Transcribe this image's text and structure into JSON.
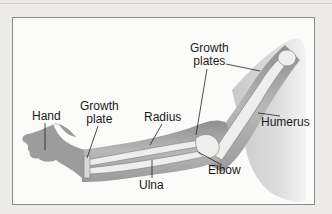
{
  "figure": {
    "labels": {
      "growth_plates": [
        "Growth",
        "plates"
      ],
      "hand": "Hand",
      "growth_plate": [
        "Growth",
        "plate"
      ],
      "radius": "Radius",
      "humerus": "Humerus",
      "elbow": "Elbow",
      "ulna": "Ulna"
    }
  },
  "colors": {
    "background": "#ecebe9",
    "panel": "#fbfbfa",
    "skin": "#a9a9a9",
    "bone": "#eeeeec",
    "text": "#1a1a1a"
  }
}
